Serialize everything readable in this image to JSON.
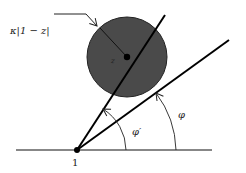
{
  "diagram": {
    "labels": {
      "radius": "κ|1 − z|",
      "center": "z",
      "origin": "1",
      "angle_inner": "φ′",
      "angle_outer": "φ"
    },
    "colors": {
      "disk_fill": "#4a4a4a",
      "line": "#111111",
      "background": "#ffffff"
    },
    "geometry": {
      "origin": [
        77,
        150
      ],
      "disk_center": [
        127,
        57
      ],
      "disk_radius": 40,
      "steep_ray_end": [
        165,
        15
      ],
      "shallow_ray_end": [
        229,
        40
      ]
    }
  }
}
